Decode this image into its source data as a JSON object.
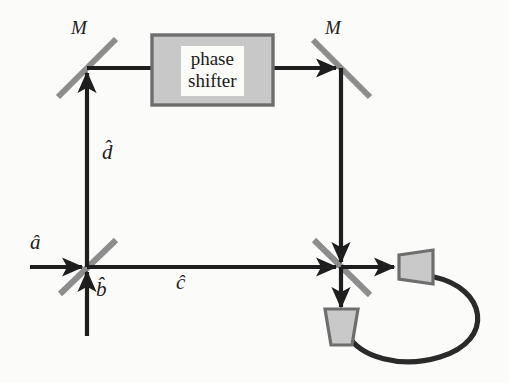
{
  "figure": {
    "width": 509,
    "height": 383,
    "background_color": "#fbfbfa"
  },
  "colors": {
    "beam_line": "#1e1e1e",
    "mirror_gray": "#8d8d8d",
    "beamsplitter_gray": "#8d8d8d",
    "box_fill": "#c8c8c8",
    "box_border": "#6e6e6e",
    "detector_fill": "#c9c9c9",
    "detector_border": "#6e6e6e",
    "cable": "#2a2a2a",
    "label_text": "#1d1d1d"
  },
  "labels": {
    "mirror_left": "M",
    "mirror_right": "M",
    "mode_a": "â",
    "mode_b": "b̂",
    "mode_c": "ĉ",
    "mode_d": "d̂"
  },
  "phase_shifter": {
    "line1": "phase",
    "line2": "shifter"
  },
  "components": [
    {
      "name": "beamsplitter-1",
      "kind": "beamsplitter",
      "orientation": "slash",
      "x": 87,
      "y": 267
    },
    {
      "name": "mirror-left",
      "kind": "mirror",
      "orientation": "slash",
      "x": 87,
      "y": 68
    },
    {
      "name": "mirror-right",
      "kind": "mirror",
      "orientation": "backslash",
      "x": 341,
      "y": 68
    },
    {
      "name": "phase-shifter",
      "kind": "box",
      "x": 152,
      "y": 35,
      "w": 121,
      "h": 70
    },
    {
      "name": "beamsplitter-2",
      "kind": "beamsplitter",
      "orientation": "backslash",
      "x": 341,
      "y": 267
    },
    {
      "name": "detector-right",
      "kind": "detector",
      "orientation": "right",
      "x": 398,
      "y": 267
    },
    {
      "name": "detector-bottom",
      "kind": "detector",
      "orientation": "down",
      "x": 341,
      "y": 322
    }
  ],
  "beams": [
    {
      "name": "input-a",
      "from": "left-edge",
      "to": "beamsplitter-1",
      "direction": "rightward"
    },
    {
      "name": "input-b",
      "from": "bottom-edge",
      "to": "beamsplitter-1",
      "direction": "upward"
    },
    {
      "name": "path-d",
      "from": "beamsplitter-1",
      "to": "mirror-left",
      "direction": "upward"
    },
    {
      "name": "path-upper",
      "from": "mirror-left",
      "to": "phase-shifter",
      "direction": "rightward"
    },
    {
      "name": "path-upper-2",
      "from": "phase-shifter",
      "to": "mirror-right",
      "direction": "rightward"
    },
    {
      "name": "path-right-down",
      "from": "mirror-right",
      "to": "beamsplitter-2",
      "direction": "downward"
    },
    {
      "name": "path-c",
      "from": "beamsplitter-1",
      "to": "beamsplitter-2",
      "direction": "rightward"
    },
    {
      "name": "output-right",
      "from": "beamsplitter-2",
      "to": "detector-right",
      "direction": "rightward"
    },
    {
      "name": "output-down",
      "from": "beamsplitter-2",
      "to": "detector-bottom",
      "direction": "downward"
    }
  ],
  "cable": {
    "name": "coincidence-cable",
    "from": "detector-right",
    "to": "detector-bottom"
  }
}
